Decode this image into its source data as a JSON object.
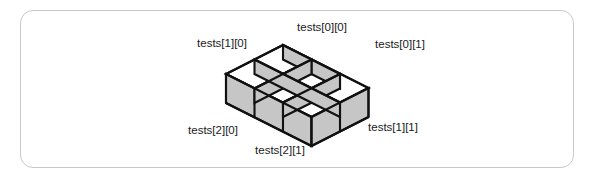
{
  "figure": {
    "kind": "isometric-2d-array-diagram",
    "panel": {
      "border_color": "#c9c9c9",
      "background_color": "#ffffff",
      "corner_radius": "13px"
    },
    "colors": {
      "box_side_fill": "#c6c6c6",
      "box_top_fill": "#ffffff",
      "outline": "#111111",
      "label_text": "#1a1a1a"
    },
    "array_name": "tests",
    "rows": 3,
    "columns": 2,
    "labels": [
      {
        "id": "tests-0-0",
        "text": "tests[0][0]",
        "x": 322,
        "y": 31,
        "anchor": "middle"
      },
      {
        "id": "tests-1-0",
        "text": "tests[1][0]",
        "x": 222,
        "y": 47,
        "anchor": "middle"
      },
      {
        "id": "tests-0-1",
        "text": "tests[0][1]",
        "x": 400,
        "y": 48,
        "anchor": "middle"
      },
      {
        "id": "tests-2-0",
        "text": "tests[2][0]",
        "x": 213,
        "y": 134,
        "anchor": "middle"
      },
      {
        "id": "tests-1-1",
        "text": "tests[1][1]",
        "x": 393,
        "y": 131,
        "anchor": "middle"
      },
      {
        "id": "tests-2-1",
        "text": "tests[2][1]",
        "x": 280,
        "y": 154,
        "anchor": "middle"
      }
    ]
  }
}
